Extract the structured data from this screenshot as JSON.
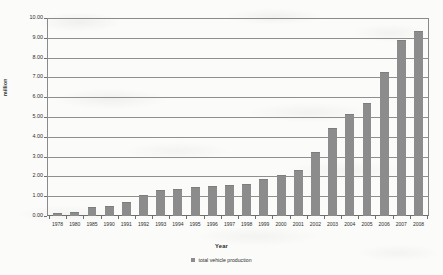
{
  "chart_data": {
    "type": "bar",
    "title": "",
    "xlabel": "Year",
    "ylabel": "million",
    "ylim": [
      0,
      10
    ],
    "ytick_step": 1,
    "ytick_labels": [
      "0.00",
      "1.00",
      "2.00",
      "3.00",
      "4.00",
      "5.00",
      "6.00",
      "7.00",
      "8.00",
      "9.00",
      "10.00"
    ],
    "grid": true,
    "legend_position": "bottom",
    "legend": [
      "total vehicle production"
    ],
    "series_name": "total vehicle production",
    "series_color": "#8c8c8c",
    "categories": [
      "1978",
      "1980",
      "1985",
      "1990",
      "1991",
      "1992",
      "1993",
      "1994",
      "1995",
      "1996",
      "1997",
      "1998",
      "1999",
      "2000",
      "2001",
      "2002",
      "2003",
      "2004",
      "2005",
      "2006",
      "2007",
      "2008"
    ],
    "values": [
      0.15,
      0.22,
      0.44,
      0.51,
      0.71,
      1.06,
      1.3,
      1.38,
      1.45,
      1.5,
      1.59,
      1.63,
      1.87,
      2.07,
      2.34,
      3.25,
      4.44,
      5.15,
      5.71,
      7.28,
      8.88,
      9.35
    ]
  },
  "axis": {
    "y_title": "million",
    "x_title": "Year"
  },
  "legend": {
    "marker": "square-swatch-icon",
    "label": "total vehicle production"
  }
}
